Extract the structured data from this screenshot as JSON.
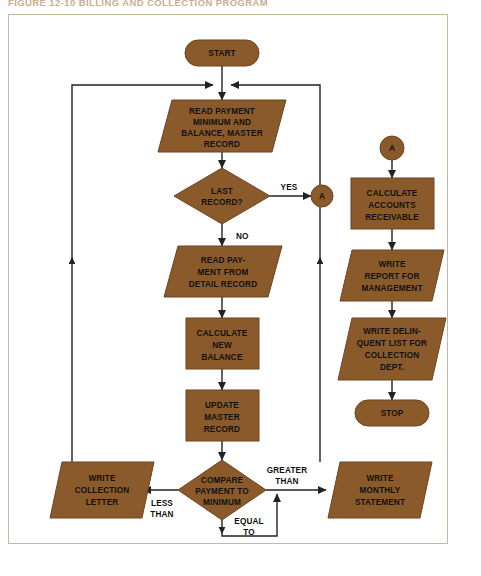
{
  "figure": {
    "title": "FIGURE 12-10  BILLING AND COLLECTION PROGRAM"
  },
  "colors": {
    "shape_fill": "#8B5A2B",
    "shape_stroke": "#6d4522",
    "line": "#222222",
    "frame_border": "#cbb79e",
    "page_background": "#ffffff",
    "text": "#111111",
    "title_text": "#c9ae92"
  },
  "flowchart": {
    "type": "flowchart",
    "orientation": "two-column",
    "nodes": [
      {
        "id": "start",
        "shape": "terminator",
        "label": "START",
        "lines": [
          "START"
        ]
      },
      {
        "id": "read_master",
        "shape": "parallelogram",
        "label": "READ PAYMENT MINIMUM AND BALANCE, MASTER RECORD",
        "lines": [
          "READ PAYMENT",
          "MINIMUM AND",
          "BALANCE, MASTER",
          "RECORD"
        ]
      },
      {
        "id": "last_record",
        "shape": "decision",
        "label": "LAST RECORD?",
        "lines": [
          "LAST",
          "RECORD?"
        ]
      },
      {
        "id": "conn_a_out",
        "shape": "connector",
        "label": "A",
        "lines": [
          "A"
        ]
      },
      {
        "id": "read_detail",
        "shape": "parallelogram",
        "label": "READ PAYMENT FROM DETAIL RECORD",
        "lines": [
          "READ PAY-",
          "MENT FROM",
          "DETAIL RECORD"
        ]
      },
      {
        "id": "calc_bal",
        "shape": "process",
        "label": "CALCULATE NEW BALANCE",
        "lines": [
          "CALCULATE",
          "NEW",
          "BALANCE"
        ]
      },
      {
        "id": "update_mas",
        "shape": "process",
        "label": "UPDATE MASTER RECORD",
        "lines": [
          "UPDATE",
          "MASTER",
          "RECORD"
        ]
      },
      {
        "id": "compare",
        "shape": "decision",
        "label": "COMPARE PAYMENT TO MINIMUM",
        "lines": [
          "COMPARE",
          "PAYMENT TO",
          "MINIMUM"
        ]
      },
      {
        "id": "write_coll",
        "shape": "parallelogram",
        "label": "WRITE COLLECTION LETTER",
        "lines": [
          "WRITE",
          "COLLECTION",
          "LETTER"
        ]
      },
      {
        "id": "write_month",
        "shape": "parallelogram",
        "label": "WRITE MONTHLY STATEMENT",
        "lines": [
          "WRITE",
          "MONTHLY",
          "STATEMENT"
        ]
      },
      {
        "id": "conn_a_in",
        "shape": "connector",
        "label": "A",
        "lines": [
          "A"
        ]
      },
      {
        "id": "calc_ar",
        "shape": "process",
        "label": "CALCULATE ACCOUNTS RECEIVABLE",
        "lines": [
          "CALCULATE",
          "ACCOUNTS",
          "RECEIVABLE"
        ]
      },
      {
        "id": "write_rep",
        "shape": "parallelogram",
        "label": "WRITE REPORT FOR MANAGEMENT",
        "lines": [
          "WRITE",
          "REPORT FOR",
          "MANAGEMENT"
        ]
      },
      {
        "id": "write_delq",
        "shape": "parallelogram",
        "label": "WRITE DELINQUENT LIST FOR COLLECTION DEPT.",
        "lines": [
          "WRITE DELIN-",
          "QUENT LIST FOR",
          "COLLECTION",
          "DEPT."
        ]
      },
      {
        "id": "stop",
        "shape": "terminator",
        "label": "STOP",
        "lines": [
          "STOP"
        ]
      }
    ],
    "edge_labels": [
      {
        "id": "yes",
        "text": "YES",
        "lines": [
          "YES"
        ],
        "from": "last_record",
        "to": "conn_a_out"
      },
      {
        "id": "no",
        "text": "NO",
        "lines": [
          "NO"
        ],
        "from": "last_record",
        "to": "read_detail"
      },
      {
        "id": "less_than",
        "text": "LESS THAN",
        "lines": [
          "LESS",
          "THAN"
        ],
        "from": "compare",
        "to": "write_coll"
      },
      {
        "id": "greater_than",
        "text": "GREATER THAN",
        "lines": [
          "GREATER",
          "THAN"
        ],
        "from": "compare",
        "to": "write_month"
      },
      {
        "id": "equal_to",
        "text": "EQUAL TO",
        "lines": [
          "EQUAL",
          "TO"
        ],
        "from": "compare",
        "to": "write_month"
      }
    ]
  }
}
